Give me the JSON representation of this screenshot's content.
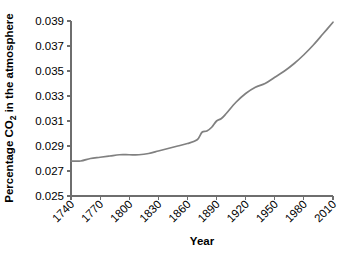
{
  "chart_data": {
    "type": "line",
    "title": "",
    "xlabel": "Year",
    "ylabel_parts": {
      "pre": "Percentage CO",
      "sub": "2",
      "post": " in the atmosphere"
    },
    "ylabel": "Percentage CO2 in the atmosphere",
    "xlim": [
      1740,
      2010
    ],
    "ylim": [
      0.025,
      0.039
    ],
    "xticks": [
      1740,
      1770,
      1800,
      1830,
      1860,
      1890,
      1920,
      1950,
      1980,
      2010
    ],
    "xtick_labels": [
      "1740",
      "1770",
      "1800",
      "1830",
      "1860",
      "1890",
      "1920",
      "1950",
      "1980",
      "2010"
    ],
    "yticks": [
      0.025,
      0.027,
      0.029,
      0.031,
      0.033,
      0.035,
      0.037,
      0.039
    ],
    "ytick_labels": [
      "0.025",
      "0.027",
      "0.029",
      "0.031",
      "0.033",
      "0.035",
      "0.037",
      "0.039"
    ],
    "grid": false,
    "legend": "none",
    "line_color": "#808080",
    "axis_color": "#6e6e6e",
    "series": [
      {
        "name": "Atmospheric CO2",
        "x": [
          1740,
          1750,
          1760,
          1770,
          1780,
          1790,
          1800,
          1810,
          1820,
          1830,
          1840,
          1850,
          1860,
          1870,
          1875,
          1880,
          1885,
          1890,
          1895,
          1900,
          1910,
          1920,
          1930,
          1940,
          1950,
          1960,
          1970,
          1980,
          1990,
          2000,
          2010
        ],
        "y": [
          0.0278,
          0.0278,
          0.028,
          0.0281,
          0.0282,
          0.0283,
          0.0283,
          0.0283,
          0.0284,
          0.0286,
          0.0288,
          0.029,
          0.0292,
          0.0295,
          0.0301,
          0.0302,
          0.0305,
          0.031,
          0.0312,
          0.0316,
          0.0325,
          0.0332,
          0.0337,
          0.034,
          0.0345,
          0.035,
          0.0356,
          0.0363,
          0.0371,
          0.038,
          0.0389
        ]
      }
    ]
  },
  "plot_geometry": {
    "left": 71,
    "right": 333,
    "top": 21,
    "bottom": 196
  }
}
